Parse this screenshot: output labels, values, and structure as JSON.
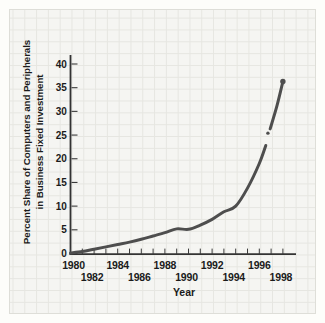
{
  "page": {
    "background_color": "#fdfdfa",
    "panel_background": "#f5f5f2",
    "grid_line_color": "#e6e6e1",
    "axis_color": "#333333",
    "text_color": "#1b1b1b"
  },
  "chart_data": {
    "type": "line",
    "title": "",
    "xlabel": "Year",
    "ylabel_line1": "Percent Share of Computers and Peripherals",
    "ylabel_line2": "in Business Fixed Investment",
    "x": [
      1980,
      1981,
      1982,
      1983,
      1984,
      1985,
      1986,
      1987,
      1988,
      1989,
      1990,
      1991,
      1992,
      1993,
      1994,
      1995,
      1996,
      1997,
      1998
    ],
    "values": [
      0.1,
      0.4,
      0.9,
      1.4,
      1.9,
      2.4,
      3.0,
      3.7,
      4.4,
      5.2,
      5.1,
      6.0,
      7.2,
      8.8,
      10.0,
      13.8,
      19.0,
      26.0,
      36.3
    ],
    "xlim": [
      1980,
      1998
    ],
    "ylim": [
      0,
      40
    ],
    "yticks": [
      0,
      5,
      10,
      15,
      20,
      25,
      30,
      35,
      40
    ],
    "xlabel_row1": [
      1980,
      1984,
      1988,
      1992,
      1996
    ],
    "xlabel_row2": [
      1982,
      1986,
      1990,
      1994,
      1998
    ],
    "grid": "graph-paper background, on",
    "legend": "none",
    "line_color": "#4e4e4e",
    "line_width": 3,
    "end_marker": {
      "x": 1998,
      "value": 36.3
    },
    "stroke_gap": {
      "x": 1996.73,
      "value": 24.0
    },
    "gap_dot": {
      "x": 1996.73,
      "value": 25.4
    }
  }
}
